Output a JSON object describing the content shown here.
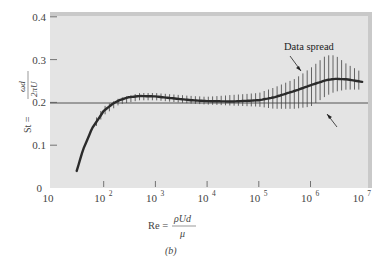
{
  "chart_data": {
    "type": "line",
    "title": "",
    "subtitle": "",
    "caption": "(b)",
    "xlabel": "Re = ρUd / μ",
    "xlabel_parts": {
      "lhs": "Re =",
      "numerator": "ρUd",
      "denominator": "μ"
    },
    "ylabel": "St = ωd / 2πU",
    "ylabel_parts": {
      "lhs": "St =",
      "numerator": "ωd",
      "denominator": "2πU"
    },
    "xscale": "log",
    "xlim": [
      10,
      10000000
    ],
    "ylim": [
      0,
      0.4
    ],
    "x_ticks": [
      {
        "base": "10",
        "exp": ""
      },
      {
        "base": "10",
        "exp": "2"
      },
      {
        "base": "10",
        "exp": "3"
      },
      {
        "base": "10",
        "exp": "4"
      },
      {
        "base": "10",
        "exp": "5"
      },
      {
        "base": "10",
        "exp": "6"
      },
      {
        "base": "10",
        "exp": "7"
      }
    ],
    "y_ticks": [
      "0",
      "0.1",
      "0.2",
      "0.3",
      "0.4"
    ],
    "grid": false,
    "reference_line": {
      "y": 0.2
    },
    "annotations": [
      {
        "text": "Data spread",
        "points_to": "vertical scatter bars near Re≈3×10^5"
      },
      {
        "text": "",
        "points_to": "mean curve near Re≈2×10^6 (arrow only)"
      }
    ],
    "series": [
      {
        "name": "Mean Strouhal number",
        "x": [
          30,
          40,
          60,
          100,
          150,
          200,
          300,
          500,
          1000,
          2000,
          5000,
          10000,
          30000,
          100000,
          200000,
          500000,
          1000000,
          2000000,
          3000000,
          5000000,
          10000000
        ],
        "y": [
          0.04,
          0.09,
          0.14,
          0.18,
          0.197,
          0.205,
          0.212,
          0.215,
          0.214,
          0.21,
          0.205,
          0.203,
          0.202,
          0.205,
          0.212,
          0.227,
          0.24,
          0.252,
          0.255,
          0.254,
          0.248
        ]
      },
      {
        "name": "Data spread (upper)",
        "x": [
          60,
          100,
          200,
          500,
          1000,
          5000,
          10000,
          100000,
          200000,
          500000,
          1000000,
          2000000,
          3000000,
          5000000,
          10000000
        ],
        "y": [
          0.15,
          0.19,
          0.21,
          0.222,
          0.222,
          0.215,
          0.213,
          0.222,
          0.235,
          0.255,
          0.28,
          0.31,
          0.31,
          0.29,
          0.27
        ]
      },
      {
        "name": "Data spread (lower)",
        "x": [
          60,
          100,
          200,
          500,
          1000,
          5000,
          10000,
          100000,
          200000,
          500000,
          1000000,
          2000000,
          3000000,
          5000000,
          10000000
        ],
        "y": [
          0.13,
          0.17,
          0.195,
          0.205,
          0.205,
          0.197,
          0.195,
          0.19,
          0.185,
          0.185,
          0.19,
          0.215,
          0.225,
          0.23,
          0.23
        ]
      }
    ],
    "annotation_label": "Data spread"
  }
}
